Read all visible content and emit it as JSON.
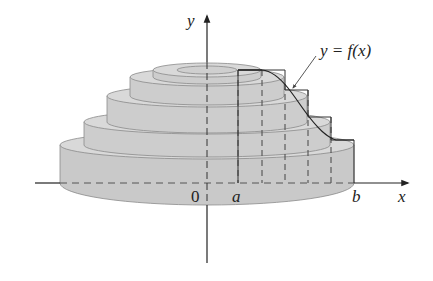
{
  "figure": {
    "labels": {
      "y_axis": "y",
      "x_axis": "x",
      "origin": "0",
      "a": "a",
      "b": "b",
      "curve": "y = f(x)"
    },
    "disk_count": 5,
    "partition_lines": 5,
    "colors": {
      "solid_fill": "#d2d2d2",
      "solid_side": "#c4c4c4",
      "edge": "#7a7a7a",
      "axis": "#222222",
      "curve": "#333333"
    }
  }
}
